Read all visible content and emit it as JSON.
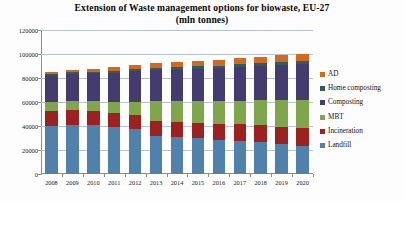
{
  "chart_data": {
    "type": "bar",
    "bar_mode": "stacked",
    "title": "Extension of Waste management options for biowaste, EU-27",
    "subtitle": "(mln tonnes)",
    "xlabel": "",
    "ylabel": "",
    "ylim": [
      0,
      120000
    ],
    "ytick_values": [
      0,
      20000,
      40000,
      60000,
      80000,
      100000,
      120000
    ],
    "ytick_labels": [
      "0",
      "20000",
      "40000",
      "60000",
      "80000",
      "100000",
      "120000"
    ],
    "grid": true,
    "legend_position": "right",
    "categories": [
      "2008",
      "2009",
      "2010",
      "2011",
      "2012",
      "2013",
      "2014",
      "2015",
      "2016",
      "2017",
      "2018",
      "2019",
      "2020"
    ],
    "series": [
      {
        "name": "Landfill",
        "color": "#4f81ab",
        "values": [
          40000,
          40500,
          40500,
          39500,
          37500,
          32000,
          30500,
          30000,
          28500,
          27500,
          26500,
          25000,
          23000
        ]
      },
      {
        "name": "Incineration",
        "color": "#9c2222",
        "values": [
          12500,
          12500,
          12000,
          11500,
          11500,
          12000,
          12500,
          12500,
          13500,
          14000,
          14000,
          14500,
          15000
        ]
      },
      {
        "name": "MBT",
        "color": "#7fa64a",
        "values": [
          7500,
          7500,
          8000,
          9000,
          11000,
          16500,
          17500,
          18000,
          18500,
          19500,
          21000,
          22500,
          24000
        ]
      },
      {
        "name": "Composting",
        "color": "#443c6e",
        "values": [
          22500,
          23000,
          23500,
          24500,
          25500,
          26000,
          26500,
          27000,
          27500,
          28000,
          28500,
          29000,
          29500
        ]
      },
      {
        "name": "Home composting",
        "color": "#2c5d61",
        "values": [
          1000,
          1200,
          1400,
          1600,
          1800,
          2000,
          2200,
          2300,
          2400,
          2500,
          2600,
          2700,
          2800
        ]
      },
      {
        "name": "AD",
        "color": "#d2691e",
        "values": [
          1500,
          1800,
          2200,
          2800,
          3500,
          4000,
          4200,
          4400,
          4600,
          4800,
          5000,
          5200,
          5400
        ]
      }
    ],
    "legend_entries": [
      {
        "label": "AD",
        "color": "#d2691e"
      },
      {
        "label": "Home composting",
        "color": "#2c5d61"
      },
      {
        "label": "Composting",
        "color": "#443c6e"
      },
      {
        "label": "MBT",
        "color": "#7fa64a"
      },
      {
        "label": "Incineration",
        "color": "#9c2222"
      },
      {
        "label": "Landfill",
        "color": "#4f81ab"
      }
    ]
  }
}
